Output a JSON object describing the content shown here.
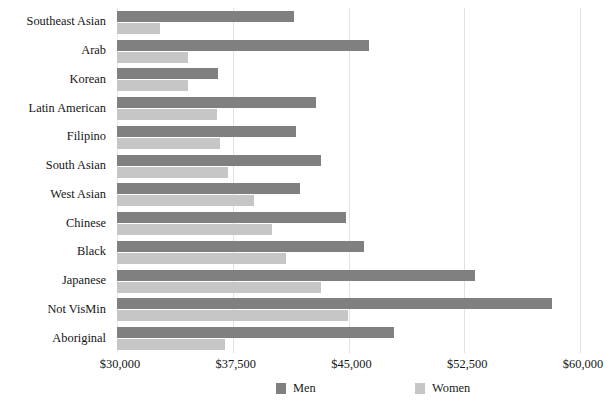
{
  "chart_data": {
    "type": "bar",
    "orientation": "horizontal",
    "title": "",
    "subtitle": "",
    "xlabel": "",
    "ylabel": "",
    "xlim": [
      30000,
      60000
    ],
    "xticks": [
      30000,
      37500,
      45000,
      52500,
      60000
    ],
    "xtick_labels": [
      "$30,000",
      "$37,500",
      "$45,000",
      "$52,500",
      "$60,000"
    ],
    "grid": true,
    "grid_axis": "x",
    "legend_position": "bottom-center",
    "categories": [
      "Southeast Asian",
      "Arab",
      "Korean",
      "Latin American",
      "Filipino",
      "South Asian",
      "West Asian",
      "Chinese",
      "Black",
      "Japanese",
      "Not VisMin",
      "Aboriginal"
    ],
    "series": [
      {
        "name": "Men",
        "color": "#808080",
        "values": [
          41450,
          46350,
          36550,
          42900,
          41600,
          43200,
          41850,
          44850,
          46000,
          53200,
          58200,
          47950
        ]
      },
      {
        "name": "Women",
        "color": "#c6c6c6",
        "values": [
          32800,
          34600,
          34600,
          36500,
          36700,
          37200,
          38900,
          40050,
          40950,
          43200,
          44950,
          37000
        ]
      }
    ]
  },
  "legend": {
    "items": [
      {
        "label": "Men",
        "swatch": "men-swatch"
      },
      {
        "label": "Women",
        "swatch": "women-swatch"
      }
    ]
  },
  "colors": {
    "men": "#808080",
    "women": "#c6c6c6",
    "gridline": "#e2e2e2",
    "background": "#ffffff",
    "text": "#151515"
  }
}
